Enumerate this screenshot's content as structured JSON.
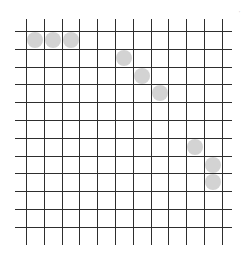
{
  "board": {
    "columns": 12,
    "rows": 12,
    "origin_x": 26,
    "origin_y": 31,
    "cell_size": 17.8,
    "line_color": "#2e2e2e",
    "stone_color": "#d3d3d3"
  },
  "stones": [
    {
      "col": 0,
      "row": 0
    },
    {
      "col": 1,
      "row": 0
    },
    {
      "col": 2,
      "row": 0
    },
    {
      "col": 5,
      "row": 1
    },
    {
      "col": 6,
      "row": 2
    },
    {
      "col": 7,
      "row": 3
    },
    {
      "col": 9,
      "row": 6
    },
    {
      "col": 10,
      "row": 7
    },
    {
      "col": 10,
      "row": 8
    }
  ],
  "corner_mark": "'"
}
